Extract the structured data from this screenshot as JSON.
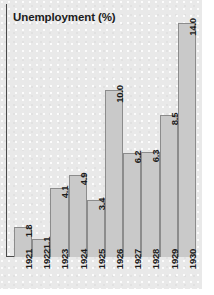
{
  "chart_data": {
    "type": "bar",
    "title": "Unemployment (%)",
    "xlabel": "",
    "ylabel": "",
    "categories": [
      "1921",
      "1922",
      "1923",
      "1924",
      "1925",
      "1926",
      "1927",
      "1928",
      "1929",
      "1930"
    ],
    "values": [
      1.8,
      1.1,
      4.1,
      4.9,
      3.4,
      10.0,
      6.2,
      6.3,
      8.5,
      14.0
    ],
    "value_labels": [
      "1.8",
      "1.1",
      "4.1",
      "4.9",
      "3.4",
      "10.0",
      "6.2",
      "6.3",
      "8.5",
      "14.0"
    ],
    "ylim": [
      0,
      14.0
    ],
    "grid": false,
    "legend": null,
    "axis_ticks_visible": false,
    "value_label_orientation": "vertical",
    "tick_label_orientation": "vertical"
  },
  "style": {
    "panel_background": "#e9e9e9",
    "bar_fill": "#c9c9c9",
    "bar_border": "#8c8c8c",
    "axis_color": "#4a4a4a",
    "text_color": "#1b1b1b",
    "page_background": "#ffffff"
  }
}
